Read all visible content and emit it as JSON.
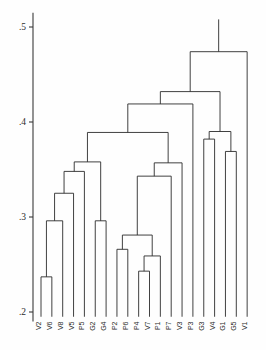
{
  "figure": {
    "title": "",
    "background_color": "#fefefe",
    "line_color": "#2b2b2b",
    "axis_color": "#3a3a3a"
  },
  "axis": {
    "name": "similarity-axis",
    "orientation": "vertical-left",
    "ticks": [
      {
        "label": ".5",
        "value": 0.5
      },
      {
        "label": ".4",
        "value": 0.4
      },
      {
        "label": ".3",
        "value": 0.3
      },
      {
        "label": ".2",
        "value": 0.2
      }
    ],
    "min": 0.19,
    "max": 0.515
  },
  "chart_data": {
    "type": "line",
    "subtype": "dendrogram",
    "title": "",
    "xlabel": "",
    "ylabel": "",
    "ylim": [
      0.19,
      0.515
    ],
    "grid": false,
    "legend": "none",
    "orientation": "vertical",
    "leaf_count": 20,
    "categories": [
      "V2",
      "V6",
      "V8",
      "V5",
      "P5",
      "G2",
      "G4",
      "P2",
      "P6",
      "P4",
      "V7",
      "P1",
      "P7",
      "V3",
      "P3",
      "G3",
      "V4",
      "G1",
      "G5",
      "V1"
    ],
    "leaf_labels": [
      "V2",
      "V6",
      "V8",
      "V5",
      "P5",
      "G2",
      "G4",
      "P2",
      "P6",
      "P4",
      "V7",
      "P1",
      "P7",
      "V3",
      "P3",
      "G3",
      "V4",
      "G1",
      "G5",
      "V1"
    ],
    "leaf_baseline": 0.195,
    "merges": [
      {
        "id": "m1",
        "left": "V2",
        "right": "V6",
        "height": 0.237,
        "label": "V2+V6"
      },
      {
        "id": "m2",
        "left": "m1",
        "right": "V8",
        "height": 0.296,
        "label": "(V2,V6)+V8"
      },
      {
        "id": "m3",
        "left": "m2",
        "right": "V5",
        "height": 0.325,
        "label": "(V2,V6,V8)+V5"
      },
      {
        "id": "m4",
        "left": "m3",
        "right": "P5",
        "height": 0.348,
        "label": "+P5"
      },
      {
        "id": "m5",
        "left": "G2",
        "right": "G4",
        "height": 0.296,
        "label": "G2+G4"
      },
      {
        "id": "m6",
        "left": "m4",
        "right": "m5",
        "height": 0.358,
        "label": "left-cluster"
      },
      {
        "id": "m7",
        "left": "P4",
        "right": "V7",
        "height": 0.243,
        "label": "P4+V7"
      },
      {
        "id": "m8",
        "left": "m7",
        "right": "P1",
        "height": 0.259,
        "label": "(P4,V7)+P1"
      },
      {
        "id": "m9",
        "left": "P2",
        "right": "P6",
        "height": 0.266,
        "label": "P2+P6"
      },
      {
        "id": "m10",
        "left": "m9",
        "right": "m8",
        "height": 0.281,
        "label": "mid-low"
      },
      {
        "id": "m11",
        "left": "m10",
        "right": "P7",
        "height": 0.343,
        "label": "+P7"
      },
      {
        "id": "m12",
        "left": "m11",
        "right": "V3",
        "height": 0.357,
        "label": "+V3"
      },
      {
        "id": "m13",
        "left": "m6",
        "right": "m12",
        "height": 0.389,
        "label": "mid-cluster"
      },
      {
        "id": "m14",
        "left": "m13",
        "right": "P3",
        "height": 0.419,
        "label": "+P3"
      },
      {
        "id": "m15",
        "left": "G3",
        "right": "V4",
        "height": 0.382,
        "label": "G3+V4"
      },
      {
        "id": "m16",
        "left": "G1",
        "right": "G5",
        "height": 0.369,
        "label": "G1+G5"
      },
      {
        "id": "m17",
        "left": "m15",
        "right": "m16",
        "height": 0.39,
        "label": "right-cluster"
      },
      {
        "id": "m18",
        "left": "m14",
        "right": "m17",
        "height": 0.432,
        "label": "upper"
      },
      {
        "id": "m19",
        "left": "m18",
        "right": "V1",
        "height": 0.474,
        "label": "root"
      }
    ],
    "root_stem_top": 0.508
  }
}
